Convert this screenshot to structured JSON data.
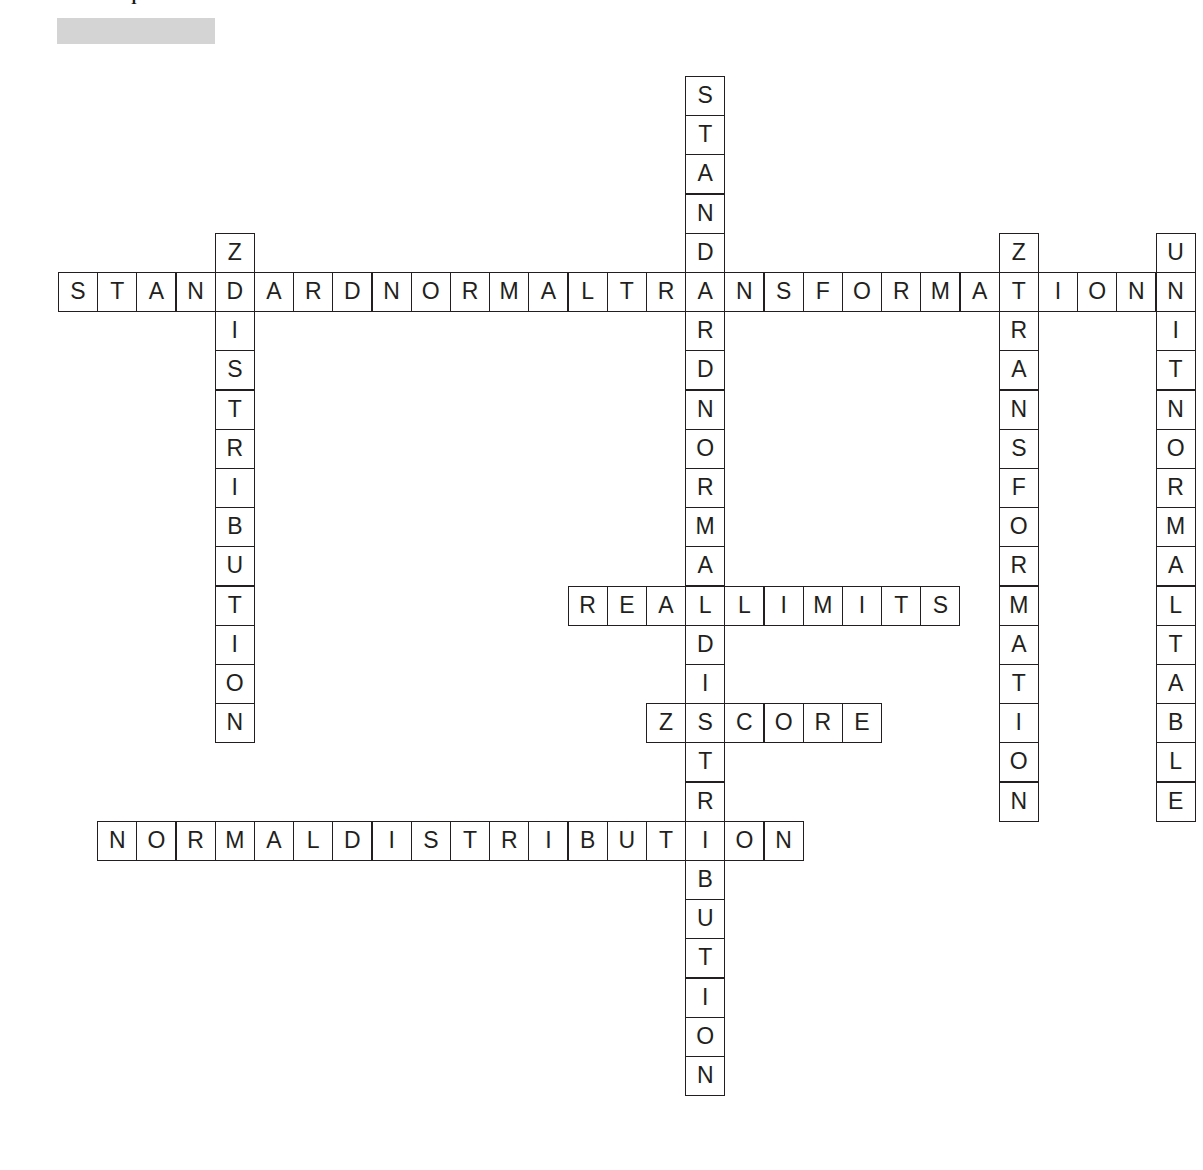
{
  "page": {
    "background_color": "#ffffff",
    "ink_color": "#231f20",
    "top_glyph": "I"
  },
  "title_placeholder": {
    "name": "redacted-title-bar",
    "color": "#d4d4d4",
    "label": ""
  },
  "grid": {
    "cell_size": 39.2,
    "origin_x": 58,
    "origin_y": 76,
    "columns": 29,
    "rows": 26
  },
  "entries": [
    {
      "id": "across-standard-normal-transformation",
      "answer": "STANDARDNORMALTRANSFORMATION",
      "display": "STANDARD NORMAL TRANSFORMATION",
      "direction": "across",
      "row": 5,
      "col": 0,
      "length": 28
    },
    {
      "id": "across-real-limits",
      "answer": "REALLIMITS",
      "display": "REAL LIMITS",
      "direction": "across",
      "row": 13,
      "col": 13,
      "length": 10
    },
    {
      "id": "across-z-score",
      "answer": "ZSCORE",
      "display": "Z SCORE",
      "direction": "across",
      "row": 16,
      "col": 15,
      "length": 6
    },
    {
      "id": "across-normal-distribution",
      "answer": "NORMALDISTRIBUTION",
      "display": "NORMAL DISTRIBUTION",
      "direction": "across",
      "row": 19,
      "col": 1,
      "length": 18
    },
    {
      "id": "down-z-distribution",
      "answer": "ZDISTRIBUTION",
      "display": "Z DISTRIBUTION",
      "direction": "down",
      "row": 4,
      "col": 4,
      "length": 13
    },
    {
      "id": "down-standard-normal-distribution",
      "answer": "STANDARDNORMALDISTRIBUTION",
      "display": "STANDARD NORMAL DISTRIBUTION",
      "direction": "down",
      "row": 0,
      "col": 16,
      "length": 26
    },
    {
      "id": "down-z-transformation",
      "answer": "ZTRANSFORMATION",
      "display": "Z TRANSFORMATION",
      "direction": "down",
      "row": 4,
      "col": 24,
      "length": 15
    },
    {
      "id": "down-unit-normal-table",
      "answer": "UNITNORMALTABLE",
      "display": "UNIT NORMAL TABLE",
      "direction": "down",
      "row": 4,
      "col": 28,
      "length": 15
    }
  ]
}
